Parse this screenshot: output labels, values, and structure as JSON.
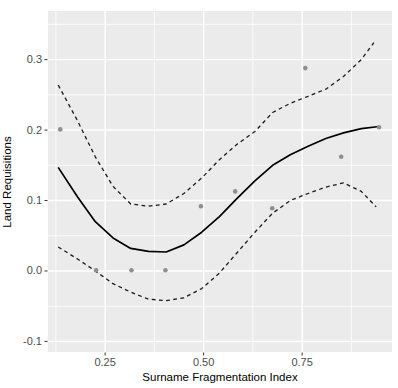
{
  "chart_data": {
    "type": "line",
    "title": "",
    "xlabel": "Surname Fragmentation Index",
    "ylabel": "Land Requisitions",
    "xlim": [
      0.105,
      0.978
    ],
    "ylim": [
      -0.115,
      0.369
    ],
    "grid": true,
    "legend": "none",
    "panel_bg": "#ebebeb",
    "grid_color": "#ffffff",
    "tick_color": "#333333",
    "x_major_ticks": [
      0.25,
      0.5,
      0.75
    ],
    "x_tick_labels": [
      "0.25",
      "0.50",
      "0.75"
    ],
    "x_minor_ticks": [
      0.125,
      0.375,
      0.625,
      0.875
    ],
    "y_major_ticks": [
      -0.1,
      0.0,
      0.1,
      0.2,
      0.3
    ],
    "y_tick_labels": [
      "-0.1",
      "0.0",
      "0.1",
      "0.2",
      "0.3"
    ],
    "y_minor_ticks": [
      -0.05,
      0.05,
      0.15,
      0.25,
      0.35
    ],
    "series": [
      {
        "name": "loess-fit",
        "style": "solid",
        "color": "#000000",
        "width": 1.7,
        "x": [
          0.131,
          0.18,
          0.225,
          0.27,
          0.315,
          0.36,
          0.405,
          0.45,
          0.495,
          0.54,
          0.585,
          0.63,
          0.675,
          0.72,
          0.765,
          0.81,
          0.855,
          0.9,
          0.945
        ],
        "y": [
          0.147,
          0.105,
          0.07,
          0.047,
          0.032,
          0.028,
          0.027,
          0.037,
          0.055,
          0.077,
          0.103,
          0.128,
          0.15,
          0.165,
          0.177,
          0.188,
          0.196,
          0.202,
          0.205
        ]
      },
      {
        "name": "ci-upper",
        "style": "dashed",
        "color": "#1a1a1a",
        "width": 1.3,
        "x": [
          0.131,
          0.18,
          0.225,
          0.27,
          0.315,
          0.36,
          0.405,
          0.45,
          0.495,
          0.54,
          0.585,
          0.63,
          0.675,
          0.72,
          0.765,
          0.81,
          0.855,
          0.9,
          0.932
        ],
        "y": [
          0.264,
          0.213,
          0.162,
          0.12,
          0.095,
          0.092,
          0.095,
          0.11,
          0.132,
          0.158,
          0.18,
          0.198,
          0.225,
          0.238,
          0.248,
          0.258,
          0.276,
          0.3,
          0.324
        ]
      },
      {
        "name": "ci-lower",
        "style": "dashed",
        "color": "#1a1a1a",
        "width": 1.3,
        "x": [
          0.131,
          0.18,
          0.225,
          0.27,
          0.315,
          0.36,
          0.405,
          0.45,
          0.495,
          0.54,
          0.585,
          0.63,
          0.675,
          0.72,
          0.765,
          0.81,
          0.855,
          0.9,
          0.938
        ],
        "y": [
          0.034,
          0.017,
          0.0,
          -0.018,
          -0.03,
          -0.04,
          -0.042,
          -0.038,
          -0.025,
          -0.003,
          0.026,
          0.055,
          0.082,
          0.1,
          0.11,
          0.119,
          0.125,
          0.113,
          0.091
        ]
      }
    ],
    "points": {
      "name": "observations",
      "color": "#8f8f8f",
      "radius": 2.3,
      "x": [
        0.136,
        0.227,
        0.317,
        0.403,
        0.493,
        0.58,
        0.674,
        0.758,
        0.849,
        0.945
      ],
      "y": [
        0.201,
        0.001,
        0.001,
        0.001,
        0.092,
        0.113,
        0.089,
        0.288,
        0.162,
        0.204
      ]
    }
  }
}
